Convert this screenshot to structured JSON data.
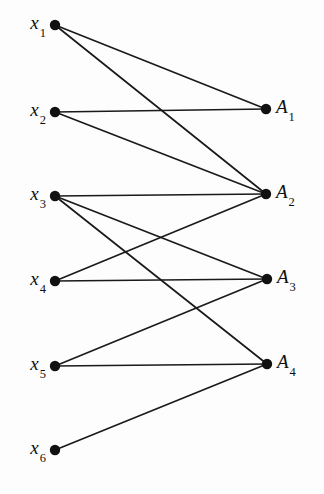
{
  "figure": {
    "type": "bipartite-graph-diagram",
    "background_color": "#fdfdfd",
    "ink_color": "#111111",
    "width": 324,
    "height": 494
  },
  "left_nodes": [
    {
      "id": "x1",
      "base": "x",
      "sub": "1",
      "x": 55,
      "y": 25
    },
    {
      "id": "x2",
      "base": "x",
      "sub": "2",
      "x": 55,
      "y": 112
    },
    {
      "id": "x3",
      "base": "x",
      "sub": "3",
      "x": 55,
      "y": 196
    },
    {
      "id": "x4",
      "base": "x",
      "sub": "4",
      "x": 55,
      "y": 281
    },
    {
      "id": "x5",
      "base": "x",
      "sub": "5",
      "x": 55,
      "y": 366
    },
    {
      "id": "x6",
      "base": "x",
      "sub": "6",
      "x": 55,
      "y": 450
    }
  ],
  "right_nodes": [
    {
      "id": "A1",
      "base": "A",
      "sub": "1",
      "x": 266,
      "y": 109
    },
    {
      "id": "A2",
      "base": "A",
      "sub": "2",
      "x": 266,
      "y": 194
    },
    {
      "id": "A3",
      "base": "A",
      "sub": "3",
      "x": 267,
      "y": 279
    },
    {
      "id": "A4",
      "base": "A",
      "sub": "4",
      "x": 267,
      "y": 364
    }
  ],
  "edges": [
    {
      "from": "x1",
      "to": "A1",
      "x1": 55,
      "y1": 25,
      "x2": 266,
      "y2": 109
    },
    {
      "from": "x1",
      "to": "A2",
      "x1": 55,
      "y1": 25,
      "x2": 266,
      "y2": 194
    },
    {
      "from": "x2",
      "to": "A1",
      "x1": 55,
      "y1": 112,
      "x2": 266,
      "y2": 109
    },
    {
      "from": "x2",
      "to": "A2",
      "x1": 55,
      "y1": 112,
      "x2": 266,
      "y2": 194
    },
    {
      "from": "x3",
      "to": "A2",
      "x1": 55,
      "y1": 196,
      "x2": 266,
      "y2": 194
    },
    {
      "from": "x3",
      "to": "A3",
      "x1": 55,
      "y1": 196,
      "x2": 267,
      "y2": 279
    },
    {
      "from": "x3",
      "to": "A4",
      "x1": 55,
      "y1": 196,
      "x2": 267,
      "y2": 364
    },
    {
      "from": "x4",
      "to": "A2",
      "x1": 55,
      "y1": 281,
      "x2": 266,
      "y2": 194
    },
    {
      "from": "x4",
      "to": "A3",
      "x1": 55,
      "y1": 281,
      "x2": 267,
      "y2": 279
    },
    {
      "from": "x5",
      "to": "A3",
      "x1": 55,
      "y1": 366,
      "x2": 267,
      "y2": 279
    },
    {
      "from": "x5",
      "to": "A4",
      "x1": 55,
      "y1": 366,
      "x2": 267,
      "y2": 364
    },
    {
      "from": "x6",
      "to": "A4",
      "x1": 55,
      "y1": 450,
      "x2": 267,
      "y2": 364
    }
  ],
  "node_radius": 5.2,
  "label_offset": 10
}
